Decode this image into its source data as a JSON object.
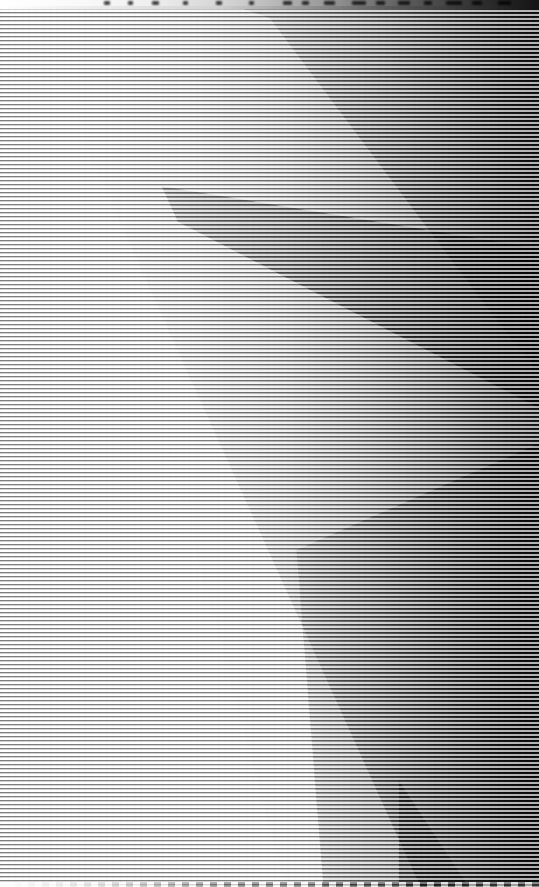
{
  "window": {
    "title": "",
    "titlebar_visible": true,
    "titlebar_height_px": 6,
    "chrome_legible": false
  },
  "capture": {
    "width_px": 539,
    "height_px": 887,
    "state_label": "",
    "content_legible": false
  },
  "corruption": {
    "kind": "interlace-scanline",
    "description": "",
    "scanline_period_px": 4,
    "scanline_dark_px": 2,
    "scanline_light_px": 2,
    "orientation": "horizontal",
    "coverage": "full-frame"
  },
  "palette": {
    "background": "#ffffff",
    "scanline_dark": "#000000",
    "scanline_light": "#ffffff",
    "mid_gray": "#9a9a9a",
    "deep_shadow": "#141414"
  },
  "regions": [
    {
      "name": "top-gradient-band",
      "tone": "light-to-dark-left-to-right",
      "bounds_px": [
        0,
        0,
        539,
        95
      ]
    },
    {
      "name": "upper-right-dark-wedge",
      "tone": "dark",
      "bounds_px": [
        230,
        0,
        309,
        300
      ]
    },
    {
      "name": "mid-diagonal-dark-band",
      "tone": "dark",
      "bounds_px": [
        180,
        150,
        359,
        180
      ]
    },
    {
      "name": "central-light-wedge",
      "tone": "near-white",
      "bounds_px": [
        0,
        85,
        420,
        802
      ]
    },
    {
      "name": "lower-right-gradient",
      "tone": "mid-to-dark",
      "bounds_px": [
        300,
        430,
        239,
        457
      ]
    },
    {
      "name": "bottom-dark-triangle",
      "tone": "dark",
      "bounds_px": [
        398,
        780,
        75,
        107
      ]
    },
    {
      "name": "bottom-dashed-edge",
      "tone": "dashed",
      "bounds_px": [
        0,
        882,
        539,
        5
      ]
    }
  ],
  "readable_text": []
}
